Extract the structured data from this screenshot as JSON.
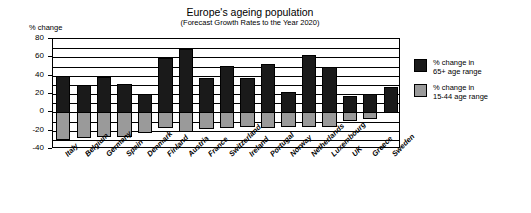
{
  "chart_data": {
    "type": "bar",
    "title": "Europe's ageing population",
    "subtitle": "(Forecast Growth Rates to the Year 2020)",
    "ylabel": "% change",
    "xlabel": "",
    "ylim": [
      -40,
      80
    ],
    "yticks": [
      80,
      60,
      40,
      20,
      0,
      -20,
      -40
    ],
    "ytick_labels": [
      "80",
      "60",
      "40",
      "20",
      "0",
      "-20",
      "-40"
    ],
    "grid": true,
    "grid_step": 10,
    "legend_position": "right",
    "stacked": false,
    "categories": [
      "Italy",
      "Belgium",
      "Germany",
      "Spain",
      "Denmark",
      "Finland",
      "Austria",
      "France",
      "Switzerland",
      "Ireland",
      "Portugal",
      "Norway",
      "Netherlands",
      "Luxembourg",
      "UK",
      "Greece",
      "Sweden"
    ],
    "series": [
      {
        "name": "% change in 65+ age range",
        "color": "#1a1a1a",
        "values": [
          40,
          30,
          39,
          31,
          20,
          59,
          69,
          38,
          51,
          38,
          53,
          22,
          63,
          49,
          18,
          20,
          28
        ]
      },
      {
        "name": "% change in 15-44 age range",
        "color": "#9a9a9a",
        "values": [
          -30,
          -28,
          -27,
          -27,
          -23,
          -17,
          -22,
          -18,
          -17,
          -16,
          -17,
          -16,
          -16,
          -16,
          -10,
          -7,
          0
        ]
      }
    ]
  },
  "legend": {
    "entries": [
      {
        "line1": "% change in",
        "line2": "65+ age range",
        "swatch": "dark"
      },
      {
        "line1": "% change in",
        "line2": "15-44 age range",
        "swatch": "grey"
      }
    ]
  }
}
